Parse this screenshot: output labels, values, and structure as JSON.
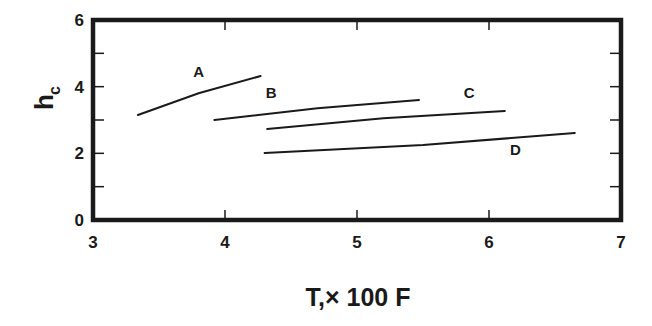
{
  "chart_data": {
    "type": "line",
    "title": "",
    "xlabel": "T,× 100 F",
    "ylabel": "h",
    "ylabel_subscript": "c",
    "xlim": [
      3,
      7
    ],
    "ylim": [
      0,
      6
    ],
    "xticks": [
      3,
      4,
      5,
      6,
      7
    ],
    "yticks": [
      0,
      2,
      4,
      6
    ],
    "yminor_ticks": [
      1,
      3,
      5
    ],
    "grid": false,
    "legend": "inline labels",
    "series": [
      {
        "name": "A",
        "x": [
          3.34,
          3.8,
          4.27
        ],
        "y": [
          3.15,
          3.8,
          4.32
        ],
        "label_pos": [
          3.8,
          4.3
        ]
      },
      {
        "name": "B",
        "x": [
          3.92,
          4.7,
          5.47
        ],
        "y": [
          3.0,
          3.35,
          3.6
        ],
        "label_pos": [
          4.35,
          3.65
        ]
      },
      {
        "name": "C",
        "x": [
          4.32,
          5.2,
          6.12
        ],
        "y": [
          2.73,
          3.05,
          3.27
        ],
        "label_pos": [
          5.85,
          3.65
        ]
      },
      {
        "name": "D",
        "x": [
          4.3,
          5.5,
          6.65
        ],
        "y": [
          2.01,
          2.25,
          2.61
        ],
        "label_pos": [
          6.2,
          1.95
        ]
      }
    ]
  },
  "colors": {
    "line": "#1a1a1a",
    "frame": "#1a1a1a",
    "background": "#ffffff"
  }
}
